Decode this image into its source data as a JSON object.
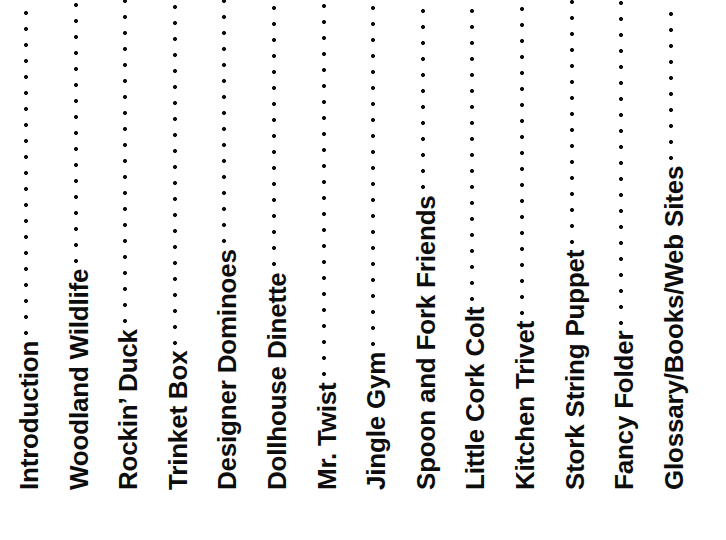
{
  "page": {
    "background_color": "#ffffff",
    "text_color": "#0d0d0d",
    "orientation": "rotated-90-ccw",
    "width": 726,
    "height": 540
  },
  "toc": {
    "leader_character": ".",
    "entries": [
      {
        "title": "Introduction",
        "page": "4"
      },
      {
        "title": "Woodland Wildlife",
        "page": "6"
      },
      {
        "title": "Rockin’ Duck",
        "page": "8"
      },
      {
        "title": "Trinket Box",
        "page": "10"
      },
      {
        "title": "Designer Dominoes",
        "page": "12"
      },
      {
        "title": "Dollhouse Dinette",
        "page": "14"
      },
      {
        "title": "Mr. Twist",
        "page": "18"
      },
      {
        "title": "Jingle Gym",
        "page": "20"
      },
      {
        "title": "Spoon and Fork Friends",
        "page": "22"
      },
      {
        "title": "Little Cork Colt",
        "page": "24"
      },
      {
        "title": "Kitchen Trivet",
        "page": "26"
      },
      {
        "title": "Stork String Puppet",
        "page": "28"
      },
      {
        "title": "Fancy Folder",
        "page": "30"
      },
      {
        "title": "Glossary/Books/Web Sites",
        "page": "32"
      }
    ]
  }
}
